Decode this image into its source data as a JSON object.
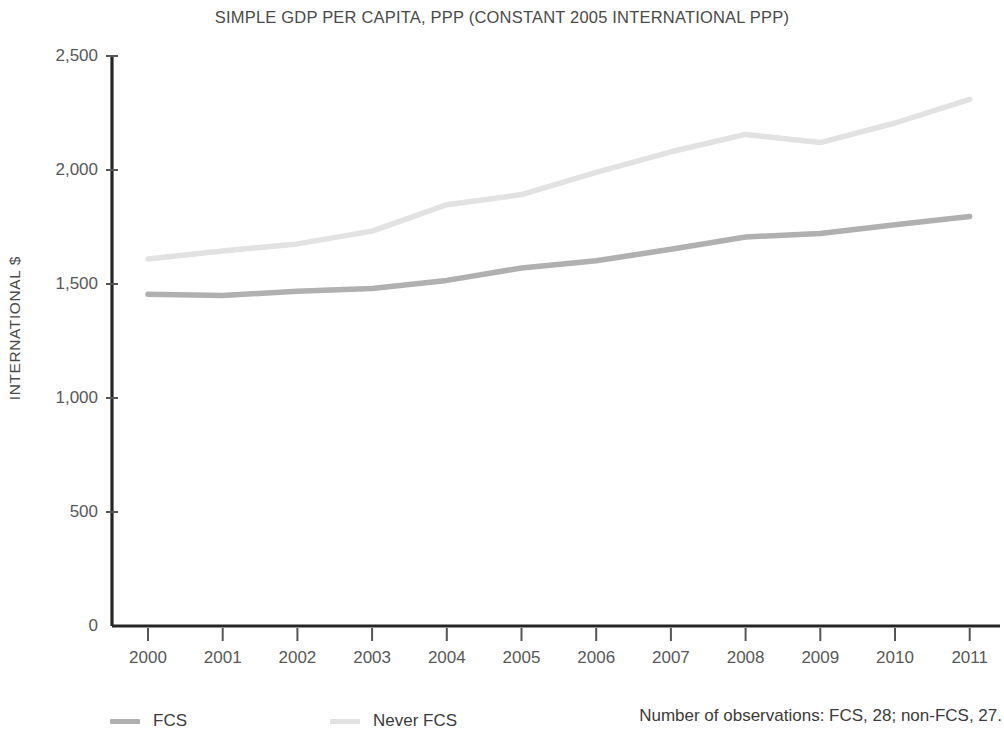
{
  "chart_data": {
    "type": "line",
    "title": "SIMPLE GDP PER CAPITA, PPP (CONSTANT 2005 INTERNATIONAL PPP)",
    "xlabel": "",
    "ylabel": "INTERNATIONAL $",
    "categories": [
      "2000",
      "2001",
      "2002",
      "2003",
      "2004",
      "2005",
      "2006",
      "2007",
      "2008",
      "2009",
      "2010",
      "2011"
    ],
    "x": [
      2000,
      2001,
      2002,
      2003,
      2004,
      2005,
      2006,
      2007,
      2008,
      2009,
      2010,
      2011
    ],
    "ylim": [
      0,
      2500
    ],
    "yticks": [
      0,
      500,
      1000,
      1500,
      2000,
      2500
    ],
    "ytick_labels": [
      "0",
      "500",
      "1,000",
      "1,500",
      "2,000",
      "2,500"
    ],
    "grid": false,
    "legend_position": "bottom-left",
    "series": [
      {
        "name": "FCS",
        "color": "#b0b0b0",
        "values": [
          1455,
          1450,
          1468,
          1480,
          1516,
          1570,
          1602,
          1652,
          1706,
          1722,
          1760,
          1796
        ]
      },
      {
        "name": "Never FCS",
        "color": "#e2e2e2",
        "values": [
          1610,
          1645,
          1676,
          1732,
          1848,
          1892,
          1990,
          2080,
          2156,
          2120,
          2206,
          2310
        ]
      }
    ],
    "annotations": [
      "Number of observations: FCS, 28; non-FCS, 27."
    ]
  },
  "legend": {
    "items": [
      {
        "label": "FCS",
        "color": "#b0b0b0"
      },
      {
        "label": "Never FCS",
        "color": "#e2e2e2"
      }
    ],
    "note": "Number of observations: FCS, 28; non-FCS, 27."
  },
  "axis": {
    "y_title": "INTERNATIONAL $",
    "y_labels": [
      "2,500",
      "2,000",
      "1,500",
      "1,000",
      "500",
      "0"
    ],
    "x_labels": [
      "2000",
      "2001",
      "2002",
      "2003",
      "2004",
      "2005",
      "2006",
      "2007",
      "2008",
      "2009",
      "2010",
      "2011"
    ]
  },
  "colors": {
    "axis": "#262626",
    "text": "#4a4a4a",
    "fcs_line": "#b0b0b0",
    "never_fcs_line": "#e2e2e2"
  }
}
